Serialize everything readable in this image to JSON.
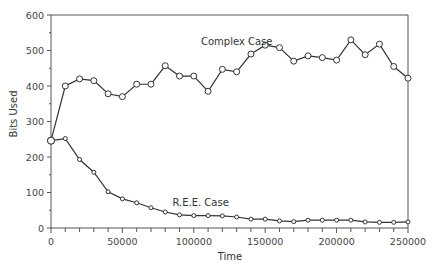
{
  "chart_data": {
    "type": "line",
    "title": "",
    "xlabel": "Time",
    "ylabel": "Bits Used",
    "xlim": [
      0,
      250000
    ],
    "ylim": [
      0,
      600
    ],
    "grid": false,
    "legend": "inline labels",
    "x_ticks": [
      0,
      50000,
      100000,
      150000,
      200000,
      250000
    ],
    "x_tick_labels": [
      "0",
      "50000",
      "100000",
      "150000",
      "200000",
      "250000"
    ],
    "x_minor_step": 10000,
    "y_ticks": [
      0,
      100,
      200,
      300,
      400,
      500,
      600
    ],
    "y_tick_labels": [
      "0",
      "100",
      "200",
      "300",
      "400",
      "500",
      "600"
    ],
    "y_minor_step": 50,
    "x": [
      0,
      10000,
      20000,
      30000,
      40000,
      50000,
      60000,
      70000,
      80000,
      90000,
      100000,
      110000,
      120000,
      130000,
      140000,
      150000,
      160000,
      170000,
      180000,
      190000,
      200000,
      210000,
      220000,
      230000,
      240000,
      250000
    ],
    "series": [
      {
        "name": "Complex Case",
        "label_pos": {
          "x": 105000,
          "y": 515
        },
        "values": [
          246,
          400,
          420,
          415,
          378,
          370,
          405,
          405,
          457,
          428,
          428,
          385,
          447,
          440,
          490,
          515,
          508,
          470,
          485,
          480,
          473,
          530,
          488,
          518,
          455,
          422
        ]
      },
      {
        "name": "R.E.E. Case",
        "label_pos": {
          "x": 85000,
          "y": 62
        },
        "values": [
          246,
          252,
          193,
          157,
          102,
          82,
          71,
          57,
          45,
          37,
          35,
          35,
          34,
          31,
          25,
          25,
          20,
          18,
          22,
          22,
          22,
          22,
          17,
          16,
          16,
          17
        ]
      }
    ]
  },
  "labels": {
    "xlabel": "Time",
    "ylabel": "Bits Used",
    "series_complex": "Complex Case",
    "series_ree": "R.E.E. Case"
  }
}
